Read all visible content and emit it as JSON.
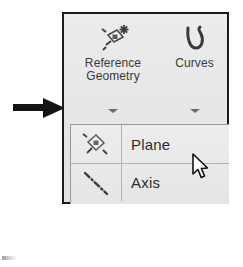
{
  "annotation": {
    "arrow": {
      "name": "callout-arrow",
      "direction": "right",
      "color": "#131313"
    }
  },
  "toolbar": {
    "border_color": "#1c1c1c",
    "background_color": "#e8e8e8",
    "buttons": [
      {
        "id": "reference-geometry",
        "label_line1": "Reference",
        "label_line2": "Geometry",
        "icon": "reference-plane-sparkle-icon",
        "has_dropdown_caret": true,
        "expanded": true
      },
      {
        "id": "curves",
        "label_line1": "Curves",
        "label_line2": "",
        "icon": "spline-curve-icon",
        "has_dropdown_caret": true,
        "expanded": false
      }
    ]
  },
  "dropdown": {
    "open": true,
    "owner": "Reference Geometry",
    "items": [
      {
        "label": "Plane",
        "icon": "plane-icon",
        "hovered": true
      },
      {
        "label": "Axis",
        "icon": "axis-centerline-icon",
        "hovered": false
      }
    ]
  },
  "cursor": {
    "type": "arrow-pointer",
    "over_item": "Plane"
  }
}
